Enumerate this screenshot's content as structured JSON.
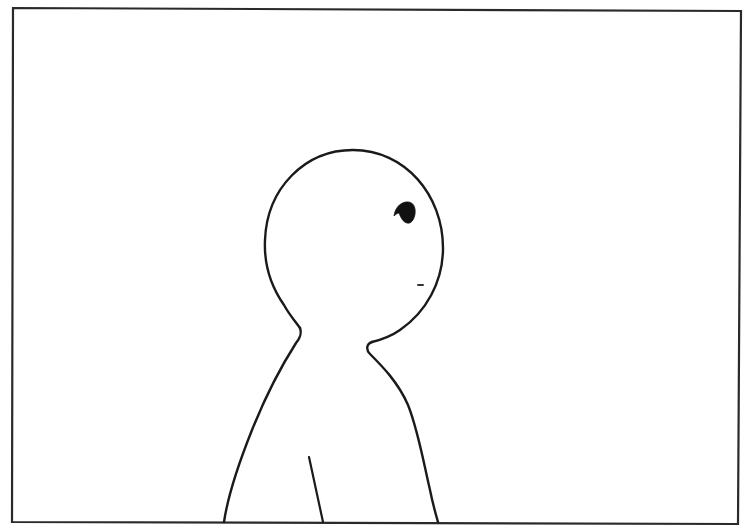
{
  "scene": {
    "type": "comic-panel",
    "description": "Simple line-drawn character, head turned to the right, seen from shoulders up, inside a rectangular panel frame",
    "colors": {
      "background": "#ffffff",
      "ink": "#1a1a1a",
      "frame": "#2a2a2a"
    },
    "elements": [
      {
        "name": "panel-frame",
        "label": "Panel border"
      },
      {
        "name": "character-head",
        "label": "Round head outline"
      },
      {
        "name": "character-eye",
        "label": "Solid black eye"
      },
      {
        "name": "character-mouth",
        "label": "Small dash mouth"
      },
      {
        "name": "character-body",
        "label": "Shoulders / torso outline"
      },
      {
        "name": "arm-line",
        "label": "Inner arm line"
      }
    ]
  }
}
